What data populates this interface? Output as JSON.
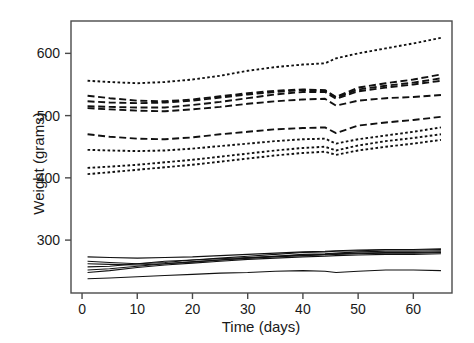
{
  "chart_data": {
    "type": "line",
    "title": "",
    "xlabel": "Time (days)",
    "ylabel": "Weight (grams)",
    "xlim": [
      -2,
      67
    ],
    "ylim": [
      215,
      652
    ],
    "xticks": [
      0,
      10,
      20,
      30,
      40,
      50,
      60
    ],
    "yticks": [
      300,
      400,
      500,
      600
    ],
    "grid": false,
    "legend": null,
    "legend_position": "none",
    "x": [
      1,
      5,
      10,
      15,
      20,
      25,
      30,
      35,
      40,
      44,
      46,
      50,
      55,
      60,
      65
    ],
    "series": [
      {
        "name": "group-a-line-1",
        "style": "dotted",
        "values": [
          556,
          554,
          552,
          554,
          558,
          564,
          572,
          578,
          582,
          584,
          592,
          600,
          608,
          616,
          625
        ]
      },
      {
        "name": "group-b-line-1",
        "style": "dashed",
        "values": [
          532,
          528,
          524,
          523,
          526,
          531,
          536,
          540,
          542,
          541,
          530,
          545,
          552,
          558,
          566
        ]
      },
      {
        "name": "group-b-line-2",
        "style": "dashed",
        "values": [
          523,
          521,
          520,
          521,
          524,
          529,
          534,
          538,
          541,
          540,
          529,
          542,
          548,
          553,
          560
        ]
      },
      {
        "name": "group-b-line-3",
        "style": "dashed",
        "values": [
          515,
          514,
          513,
          513,
          517,
          522,
          528,
          534,
          538,
          538,
          527,
          539,
          545,
          550,
          556
        ]
      },
      {
        "name": "group-b-line-4",
        "style": "dashed",
        "values": [
          512,
          510,
          508,
          507,
          510,
          514,
          519,
          523,
          526,
          527,
          516,
          524,
          528,
          530,
          533
        ]
      },
      {
        "name": "group-c-line-1",
        "style": "dashed",
        "values": [
          470,
          466,
          463,
          462,
          465,
          470,
          474,
          478,
          480,
          481,
          472,
          484,
          489,
          493,
          498
        ]
      },
      {
        "name": "group-d-line-1",
        "style": "dotted",
        "values": [
          445,
          444,
          443,
          444,
          447,
          451,
          455,
          459,
          462,
          463,
          455,
          462,
          468,
          474,
          481
        ]
      },
      {
        "name": "group-d-line-2",
        "style": "dotted",
        "values": [
          416,
          418,
          421,
          425,
          429,
          434,
          439,
          444,
          448,
          450,
          444,
          452,
          459,
          464,
          470
        ]
      },
      {
        "name": "group-d-line-3",
        "style": "dotted",
        "values": [
          406,
          409,
          413,
          417,
          421,
          426,
          431,
          436,
          440,
          442,
          437,
          444,
          450,
          455,
          461
        ]
      },
      {
        "name": "group-e-line-1",
        "style": "solid",
        "values": [
          273,
          272,
          271,
          272,
          273,
          275,
          277,
          279,
          281,
          282,
          283,
          284,
          285,
          285,
          286
        ]
      },
      {
        "name": "group-e-line-2",
        "style": "solid",
        "values": [
          266,
          264,
          262,
          264,
          268,
          271,
          274,
          277,
          280,
          281,
          282,
          283,
          284,
          284,
          285
        ]
      },
      {
        "name": "group-e-line-3",
        "style": "solid",
        "values": [
          262,
          261,
          260,
          262,
          265,
          268,
          271,
          274,
          277,
          278,
          279,
          281,
          282,
          282,
          283
        ]
      },
      {
        "name": "group-e-line-4",
        "style": "solid",
        "values": [
          257,
          258,
          262,
          266,
          268,
          270,
          272,
          274,
          276,
          277,
          278,
          279,
          280,
          280,
          281
        ]
      },
      {
        "name": "group-e-line-5",
        "style": "solid",
        "values": [
          252,
          254,
          258,
          262,
          265,
          268,
          271,
          273,
          275,
          276,
          277,
          278,
          279,
          279,
          280
        ]
      },
      {
        "name": "group-e-line-6",
        "style": "solid",
        "values": [
          248,
          251,
          256,
          260,
          263,
          266,
          269,
          271,
          273,
          274,
          275,
          276,
          277,
          277,
          278
        ]
      },
      {
        "name": "group-e-line-7",
        "style": "solid",
        "values": [
          238,
          239,
          241,
          243,
          245,
          247,
          248,
          250,
          251,
          250,
          248,
          250,
          252,
          252,
          251
        ]
      }
    ]
  },
  "axes": {
    "xlabel": "Time (days)",
    "ylabel": "Weight (grams)",
    "xticklabels": [
      "0",
      "10",
      "20",
      "30",
      "40",
      "50",
      "60"
    ],
    "yticklabels": [
      "300",
      "400",
      "500",
      "600"
    ]
  },
  "style": {
    "line_color": "#111111",
    "frame_color": "#4a4a4a",
    "background": "#ffffff",
    "tick_label_size": "14"
  }
}
